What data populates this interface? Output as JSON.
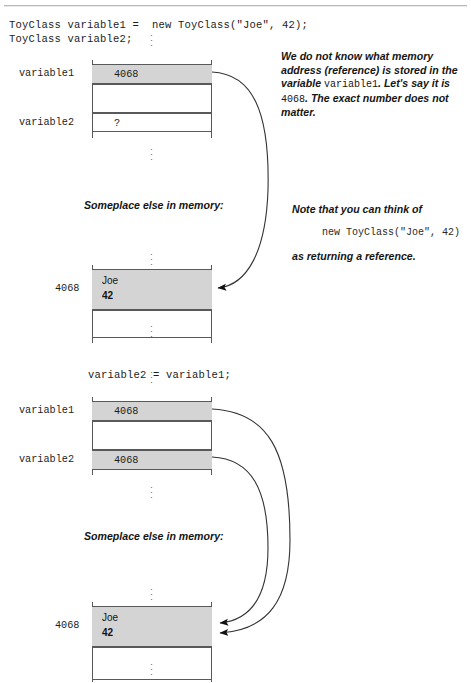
{
  "document": {
    "title": "Java object reference assignment memory diagram",
    "accent_shade": "#d4d4d4",
    "line_color": "#58595b"
  },
  "code": {
    "line1": "ToyClass variable1 =  new ToyClass(\"Joe\", 42);",
    "line2": "ToyClass variable2;",
    "assignment": "variable2 = variable1;"
  },
  "notes": {
    "address_note": {
      "part1": "We do not know what memory address (reference) is stored in the variable ",
      "code1": "variable1",
      "part2": ". Let's say it is ",
      "code2": "4068",
      "part3": ". The exact number does not matter."
    },
    "reference_note": {
      "intro": "Note that you can think of",
      "code": "new ToyClass(\"Joe\", 42)",
      "tail": "as returning a reference."
    }
  },
  "captions": {
    "memory_1": "Someplace else in memory:",
    "memory_2": "Someplace else in memory:"
  },
  "diagram_one": {
    "labels": {
      "variable1": "variable1",
      "variable2": "variable2",
      "address": "4068"
    },
    "stack_rows": [
      {
        "name": "variable1",
        "value": "4068",
        "shaded": true
      },
      {
        "name": "gap",
        "value": "",
        "shaded": false
      },
      {
        "name": "variable2",
        "value": "?",
        "shaded": false
      }
    ],
    "object": {
      "address": "4068",
      "field_name": "Joe",
      "field_value": "42"
    }
  },
  "diagram_two": {
    "labels": {
      "variable1": "variable1",
      "variable2": "variable2",
      "address": "4068"
    },
    "stack_rows": [
      {
        "name": "variable1",
        "value": "4068",
        "shaded": true
      },
      {
        "name": "gap",
        "value": "",
        "shaded": false
      },
      {
        "name": "variable2",
        "value": "4068",
        "shaded": true
      }
    ],
    "object": {
      "address": "4068",
      "field_name": "Joe",
      "field_value": "42"
    }
  },
  "ellipsis_glyph": "⋮"
}
